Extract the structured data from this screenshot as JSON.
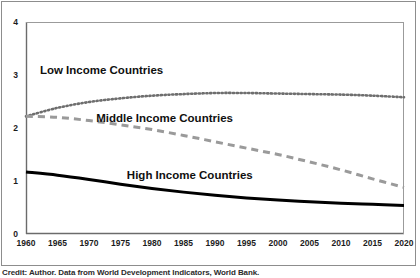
{
  "caption": "Credit: Author. Data from World Development Indicators, World Bank.",
  "colors": {
    "low_income": "#6e6e6e",
    "middle_income": "#9a9a9a",
    "high_income": "#000000",
    "axis": "#6b6b6b",
    "frame": "#8d8d8d",
    "background": "#ffffff",
    "text": "#1a1a1a"
  },
  "chart_data": {
    "type": "line",
    "title": "",
    "subtitle": "",
    "xlabel": "",
    "ylabel": "",
    "xlim": [
      1960,
      2020
    ],
    "ylim": [
      0,
      4
    ],
    "grid": false,
    "legend_position": "inline-annotations",
    "xticks": [
      "1960",
      "1965",
      "1970",
      "1975",
      "1980",
      "1985",
      "1990",
      "1995",
      "2000",
      "2005",
      "2010",
      "2015",
      "2020"
    ],
    "yticks": [
      "0",
      "1",
      "2",
      "3",
      "4"
    ],
    "x": [
      1960,
      1965,
      1970,
      1975,
      1980,
      1985,
      1990,
      1995,
      2000,
      2005,
      2010,
      2015,
      2020
    ],
    "series": [
      {
        "name": "Low Income Countries",
        "style": "dotted",
        "color": "#6e6e6e",
        "label_x": 1972,
        "label_y": 3.02,
        "values": [
          2.22,
          2.38,
          2.49,
          2.56,
          2.61,
          2.64,
          2.66,
          2.66,
          2.65,
          2.64,
          2.63,
          2.61,
          2.58
        ]
      },
      {
        "name": "Middle Income Countries",
        "style": "dashed",
        "color": "#9a9a9a",
        "label_x": 1982,
        "label_y": 2.12,
        "values": [
          2.22,
          2.2,
          2.14,
          2.06,
          1.97,
          1.86,
          1.74,
          1.62,
          1.5,
          1.36,
          1.21,
          1.04,
          0.88
        ]
      },
      {
        "name": "High Income Countries",
        "style": "solid",
        "color": "#000000",
        "label_x": 1986,
        "label_y": 1.04,
        "values": [
          1.17,
          1.11,
          1.03,
          0.94,
          0.86,
          0.79,
          0.73,
          0.68,
          0.64,
          0.61,
          0.58,
          0.56,
          0.54
        ]
      }
    ]
  }
}
